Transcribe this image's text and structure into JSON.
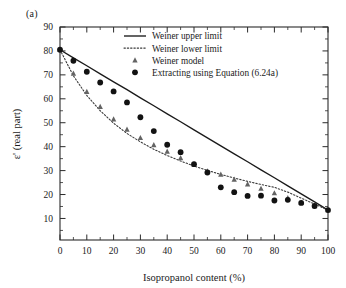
{
  "figure": {
    "panel_label": "(a)",
    "background_color": "#ffffff",
    "ink_color": "#1a1a1a"
  },
  "legend": {
    "position": "top-center",
    "entries": [
      {
        "label": "Weiner upper limit",
        "marker": "solid-line",
        "color": "#1a1a1a"
      },
      {
        "label": "Weiner lower limit",
        "marker": "dotted-line",
        "color": "#3a3a3a"
      },
      {
        "label": "Weiner model",
        "marker": "triangle",
        "color": "#636363"
      },
      {
        "label": "Extracting using Equation (6.24a)",
        "marker": "filled-circle",
        "color": "#121212"
      }
    ]
  },
  "axes": {
    "x": {
      "title": "Isopropanol content (%)",
      "min": 0,
      "max": 100,
      "major_ticks": [
        0,
        10,
        20,
        30,
        40,
        50,
        60,
        70,
        80,
        90,
        100
      ],
      "minor_ticks": [
        5,
        15,
        25,
        35,
        45,
        55,
        65,
        75,
        85,
        95
      ],
      "tick_labels": [
        "0",
        "10",
        "20",
        "30",
        "40",
        "50",
        "60",
        "70",
        "80",
        "90",
        "100"
      ]
    },
    "y": {
      "title": "ε' (real part)",
      "min": 1,
      "max": 90,
      "major_ticks": [
        10,
        20,
        30,
        40,
        50,
        60,
        70,
        80,
        90
      ],
      "minor_ticks": [
        5,
        15,
        25,
        35,
        45,
        55,
        65,
        75,
        85
      ],
      "tick_labels": [
        "10",
        "20",
        "30",
        "40",
        "50",
        "60",
        "70",
        "80",
        "90"
      ]
    }
  },
  "chart_data": {
    "type": "line",
    "title": "",
    "subtitle": "",
    "xlabel": "Isopropanol content (%)",
    "ylabel": "ε' (real part)",
    "xlim": [
      0,
      100
    ],
    "ylim": [
      1,
      90
    ],
    "grid": false,
    "legend_position": "top-center",
    "series": [
      {
        "name": "Weiner upper limit",
        "type": "line",
        "style": "solid",
        "color": "#1a1a1a",
        "x": [
          0,
          5,
          10,
          15,
          20,
          25,
          30,
          35,
          40,
          45,
          50,
          55,
          60,
          65,
          70,
          75,
          80,
          85,
          90,
          95,
          100
        ],
        "y": [
          80.5,
          77.1,
          73.8,
          70.4,
          67.1,
          63.8,
          60.4,
          57.1,
          53.7,
          50.4,
          47.0,
          43.7,
          40.3,
          37.0,
          33.7,
          30.3,
          27.0,
          23.6,
          20.3,
          16.9,
          13.5
        ]
      },
      {
        "name": "Weiner lower limit",
        "type": "line",
        "style": "dotted",
        "color": "#3a3a3a",
        "x": [
          0,
          5,
          10,
          15,
          20,
          25,
          30,
          35,
          40,
          45,
          50,
          55,
          60,
          65,
          70,
          75,
          80,
          85,
          90,
          95,
          100
        ],
        "y": [
          80.5,
          69.6,
          61.4,
          55.0,
          49.8,
          45.5,
          42.0,
          38.9,
          36.3,
          34.0,
          31.9,
          30.1,
          28.4,
          26.9,
          25.5,
          24.2,
          23.0,
          21.0,
          18.5,
          16.0,
          13.5
        ]
      },
      {
        "name": "Weiner model",
        "type": "scatter",
        "marker": "triangle",
        "color": "#636363",
        "x": [
          0,
          5,
          10,
          15,
          20,
          25,
          30,
          35,
          40,
          45,
          50,
          55,
          60,
          65,
          70,
          75,
          80,
          85,
          90,
          95,
          100
        ],
        "y": [
          80.5,
          70.6,
          63.0,
          56.7,
          51.5,
          47.2,
          43.7,
          40.7,
          38.0,
          35.3,
          32.7,
          29.8,
          28.4,
          26.3,
          24.3,
          22.5,
          20.6,
          18.6,
          16.6,
          15.2,
          13.5
        ]
      },
      {
        "name": "Extracting using Equation (6.24a)",
        "type": "scatter",
        "marker": "filled-circle",
        "color": "#121212",
        "x": [
          0,
          5,
          10,
          15,
          20,
          25,
          30,
          35,
          40,
          45,
          50,
          55,
          60,
          65,
          70,
          75,
          80,
          85,
          90,
          95,
          100
        ],
        "y": [
          80.5,
          75.9,
          71.3,
          66.8,
          63.1,
          58.5,
          52.3,
          46.5,
          40.8,
          37.7,
          32.7,
          29.2,
          23.0,
          21.0,
          19.4,
          19.5,
          17.5,
          17.8,
          16.5,
          15.2,
          13.5
        ]
      }
    ]
  }
}
